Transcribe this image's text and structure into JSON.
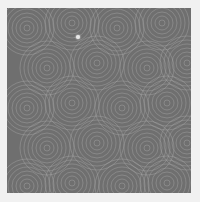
{
  "image": {
    "subject": "seamless gray concentric-circle texture",
    "background_color": "#f1f1f1",
    "tile_color": "#6f6f6f",
    "ring_color": "#a8a8a8",
    "ring_centers": [
      [
        20,
        20
      ],
      [
        65,
        15
      ],
      [
        110,
        20
      ],
      [
        155,
        15
      ],
      [
        40,
        60
      ],
      [
        90,
        55
      ],
      [
        140,
        60
      ],
      [
        180,
        55
      ],
      [
        20,
        100
      ],
      [
        65,
        95
      ],
      [
        115,
        100
      ],
      [
        160,
        95
      ],
      [
        40,
        140
      ],
      [
        90,
        135
      ],
      [
        140,
        140
      ],
      [
        180,
        135
      ],
      [
        20,
        178
      ],
      [
        65,
        175
      ],
      [
        115,
        178
      ],
      [
        160,
        175
      ]
    ],
    "sparkle": {
      "x": 78,
      "y": 37
    }
  }
}
